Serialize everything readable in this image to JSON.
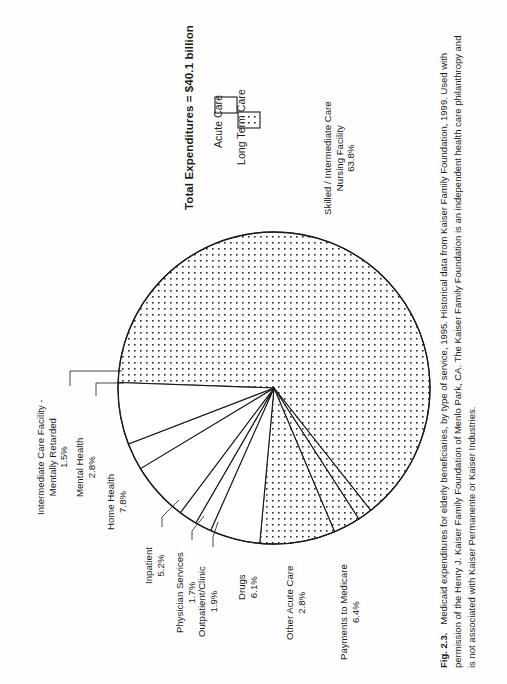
{
  "figure": {
    "label": "Fig. 2.3.",
    "caption_text": "Medicaid expenditures for elderly beneficiaries, by type of service, 1995. Historical data from Kaiser Family Foundation, 1999. Used with permission of the Henry J. Kaiser Family Foundation of Menlo Park, CA. The Kaiser Family Foundation is an independent health care philanthropy and is not associated with Kaiser Permanente or Kaiser Industries."
  },
  "chart_data": {
    "type": "pie",
    "title": "Total Expenditures = $40.1 billion",
    "xlabel": "",
    "ylabel": "",
    "legend_position": "top-right",
    "grid": false,
    "units": "percent",
    "total_label": "$40.1 billion",
    "categories": [
      "Skilled / Intermediate Care Nursing Facility",
      "Intermediate Care Facility - Mentally Retarded",
      "Mental Health",
      "Home Health",
      "Inpatient",
      "Physician Services",
      "Outpatient/Clinic",
      "Drugs",
      "Other Acute Care",
      "Payments to Medicare"
    ],
    "values": [
      63.8,
      1.5,
      2.8,
      7.8,
      5.2,
      1.7,
      1.9,
      6.1,
      2.8,
      6.4
    ],
    "groups": [
      "Long Term Care",
      "Long Term Care",
      "Long Term Care",
      "Long Term Care",
      "Acute Care",
      "Acute Care",
      "Acute Care",
      "Acute Care",
      "Acute Care",
      "Acute Care"
    ],
    "legend": [
      {
        "label": "Acute Care",
        "fill": "solid-white"
      },
      {
        "label": "Long Term Care",
        "fill": "dotted"
      }
    ]
  },
  "labels": {
    "skilled": {
      "line1": "Skilled / Intermediate Care",
      "line2": "Nursing Facility",
      "pct": "63.8%"
    },
    "icfmr": {
      "line1": "Intermediate Care Facility -",
      "line2": "Mentally Retarded",
      "pct": "1.5%"
    },
    "mental": {
      "line1": "Mental Health",
      "pct": "2.8%"
    },
    "home": {
      "line1": "Home Health",
      "pct": "7.8%"
    },
    "inpatient": {
      "line1": "Inpatient",
      "pct": "5.2%"
    },
    "physician": {
      "line1": "Physician Services",
      "pct": "1.7%"
    },
    "outpatient": {
      "line1": "Outpatient/Clinic",
      "pct": "1.9%"
    },
    "drugs": {
      "line1": "Drugs",
      "pct": "6.1%"
    },
    "other": {
      "line1": "Other Acute Care",
      "pct": "2.8%"
    },
    "medicare": {
      "line1": "Payments to Medicare",
      "pct": "6.4%"
    }
  },
  "colors": {
    "stroke": "#1a1a1a",
    "acute_fill": "#ffffff",
    "ltc_dot": "#2b2b2b",
    "page_bg": "#fefefe"
  }
}
